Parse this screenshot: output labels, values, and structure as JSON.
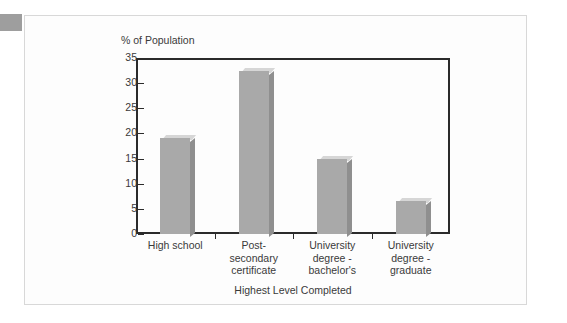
{
  "chart_data": {
    "type": "bar",
    "title": "",
    "ylabel": "% of Population",
    "xlabel": "Highest Level Completed",
    "categories": [
      "High school",
      "Post-secondary certificate",
      "University degree - bachelor's",
      "University degree - graduate"
    ],
    "category_lines": [
      [
        "High school"
      ],
      [
        "Post-",
        "secondary",
        "certificate"
      ],
      [
        "University",
        "degree -",
        "bachelor's"
      ],
      [
        "University",
        "degree -",
        "graduate"
      ]
    ],
    "values": [
      19,
      32.5,
      15,
      6.5
    ],
    "ylim": [
      0,
      35
    ],
    "yticks": [
      0,
      5,
      10,
      15,
      20,
      25,
      30,
      35
    ],
    "ytick_labels": [
      "0",
      "5",
      "10",
      "15",
      "20",
      "25",
      "30",
      "35"
    ],
    "grid": false,
    "legend": null,
    "bar_style": "3d-block",
    "colors": {
      "bar_front": "#a9a9a9",
      "bar_top": "#d6d6d6",
      "bar_side": "#8f8f8f",
      "axis": "#2b2b2b",
      "text": "#3a3a3a",
      "plot_background": "#fdfdfd",
      "card_background": "#fdfdfd",
      "card_border": "#d8d8d8",
      "corner_tab": "#9e9e9e"
    }
  }
}
